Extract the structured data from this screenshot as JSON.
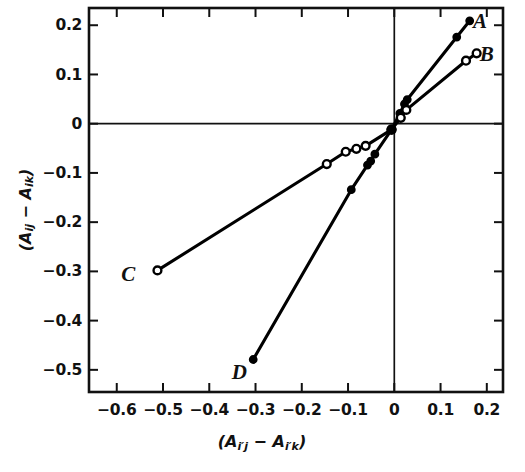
{
  "chart_data": {
    "type": "line",
    "title": "",
    "xlabel": "(A_i'j - A_i'k)",
    "ylabel": "(A_ij - A_ik)",
    "xlim": [
      -0.66,
      0.235
    ],
    "ylim": [
      -0.545,
      0.235
    ],
    "grid": false,
    "legend_position": "line-end-labels",
    "axis_zero_lines": true,
    "xticks": [
      -0.6,
      -0.5,
      -0.4,
      -0.3,
      -0.2,
      -0.1,
      0,
      0.1,
      0.2
    ],
    "xticklabels": [
      "−0.6",
      "−0.5",
      "−0.4",
      "−0.3",
      "−0.2",
      "−0.1",
      "0",
      "0.1",
      "0.2"
    ],
    "yticks": [
      0.2,
      0.1,
      0,
      -0.1,
      -0.2,
      -0.3,
      -0.4,
      -0.5
    ],
    "yticklabels": [
      "0.2",
      "0.1",
      "0",
      "−0.1",
      "−0.2",
      "−0.3",
      "−0.4",
      "−0.5"
    ],
    "series": [
      {
        "name": "A",
        "label": "A",
        "marker": "filled-circle",
        "color": "#000000",
        "label_position": {
          "x": 0.185,
          "y": 0.208
        },
        "points": [
          {
            "x": -0.006,
            "y": -0.012
          },
          {
            "x": 0.012,
            "y": 0.021
          },
          {
            "x": 0.022,
            "y": 0.04
          },
          {
            "x": 0.028,
            "y": 0.049
          },
          {
            "x": 0.135,
            "y": 0.176
          },
          {
            "x": 0.163,
            "y": 0.209
          }
        ]
      },
      {
        "name": "B",
        "label": "B",
        "marker": "open-circle",
        "color": "#000000",
        "label_position": {
          "x": 0.2,
          "y": 0.142
        },
        "points": [
          {
            "x": -0.006,
            "y": -0.012
          },
          {
            "x": 0.014,
            "y": 0.012
          },
          {
            "x": 0.026,
            "y": 0.028
          },
          {
            "x": 0.155,
            "y": 0.128
          },
          {
            "x": 0.178,
            "y": 0.143
          }
        ]
      },
      {
        "name": "C",
        "label": "C",
        "marker": "open-circle",
        "color": "#000000",
        "label_position": {
          "x": -0.575,
          "y": -0.306
        },
        "points": [
          {
            "x": -0.512,
            "y": -0.298
          },
          {
            "x": -0.146,
            "y": -0.082
          },
          {
            "x": -0.105,
            "y": -0.057
          },
          {
            "x": -0.082,
            "y": -0.051
          },
          {
            "x": -0.062,
            "y": -0.045
          },
          {
            "x": -0.006,
            "y": -0.012
          }
        ]
      },
      {
        "name": "D",
        "label": "D",
        "marker": "filled-circle",
        "color": "#000000",
        "label_position": {
          "x": -0.335,
          "y": -0.505
        },
        "points": [
          {
            "x": -0.305,
            "y": -0.479
          },
          {
            "x": -0.093,
            "y": -0.134
          },
          {
            "x": -0.058,
            "y": -0.084
          },
          {
            "x": -0.051,
            "y": -0.076
          },
          {
            "x": -0.042,
            "y": -0.062
          },
          {
            "x": -0.006,
            "y": -0.012
          }
        ]
      }
    ]
  },
  "axes": {
    "x_title_parts": {
      "a1": "(A",
      "sub1": "i′j",
      "minus": " − A",
      "sub2": "i′k",
      "close": ")"
    },
    "y_title_parts": {
      "a1": "(A",
      "sub1": "ij",
      "minus": " − A",
      "sub2": "ik",
      "close": ")"
    }
  }
}
